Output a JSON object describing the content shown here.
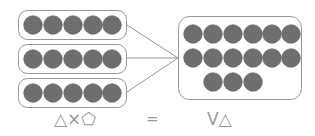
{
  "diagram": {
    "type": "grouping-multiplication",
    "colors": {
      "counter_fill": "#6e6e6e",
      "counter_stroke": "#5f5f5f",
      "box_stroke": "#8a8a8a",
      "connector_stroke": "#8a8a8a",
      "text": "#9a9a9a",
      "background": "#ffffff"
    },
    "left_groups": {
      "name": "equal-groups",
      "group_count": 3,
      "counters_per_group": 5,
      "groups": [
        {
          "label": "group-1",
          "counters": 5,
          "x": 18,
          "y": 10,
          "w": 109,
          "h": 30
        },
        {
          "label": "group-2",
          "counters": 5,
          "x": 18,
          "y": 46,
          "w": 109,
          "h": 30
        },
        {
          "label": "group-3",
          "counters": 5,
          "x": 18,
          "y": 79,
          "w": 109,
          "h": 30
        }
      ]
    },
    "right_group": {
      "name": "combined-total",
      "total_counters": 15,
      "box": {
        "x": 178,
        "y": 16,
        "w": 124,
        "h": 84
      },
      "rows": [
        {
          "label": "row-1",
          "counters": 6,
          "start_column": 1
        },
        {
          "label": "row-2",
          "counters": 6,
          "start_column": 1
        },
        {
          "label": "row-3",
          "counters": 3,
          "start_column": 2
        }
      ]
    },
    "connectors": {
      "name": "group-connector-lines",
      "count": 3,
      "converge_point": {
        "x": 178,
        "y": 58
      },
      "lines": [
        {
          "label": "connector-group-1",
          "x1": 127,
          "y1": 25,
          "x2": 178,
          "y2": 58
        },
        {
          "label": "connector-group-2",
          "x1": 127,
          "y1": 58,
          "x2": 178,
          "y2": 58
        },
        {
          "label": "connector-group-3",
          "x1": 127,
          "y1": 92,
          "x2": 178,
          "y2": 58
        }
      ]
    },
    "equation": {
      "name": "symbol-equation",
      "left_operand_text": "△×⬠",
      "left_operand_symbols": [
        "triangle",
        "multiplication-sign",
        "pentagon"
      ],
      "equals_text": "=",
      "right_operand_text": "V△",
      "right_operand_symbols": [
        "letter-v",
        "triangle"
      ]
    }
  }
}
